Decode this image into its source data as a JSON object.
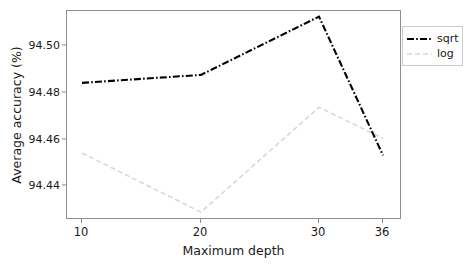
{
  "chart_data": {
    "type": "line",
    "title": "",
    "xlabel": "Maximum depth",
    "ylabel": "Average accuracy (%)",
    "categories": [
      "10",
      "20",
      "30",
      "36"
    ],
    "x_tick_positions_px": [
      81,
      200,
      318,
      382
    ],
    "y_ticks": [
      "94.44",
      "94.46",
      "94.48",
      "94.50"
    ],
    "y_tick_values": [
      94.44,
      94.46,
      94.48,
      94.5
    ],
    "ylim": [
      94.4255,
      94.5151
    ],
    "grid": false,
    "legend_position": "upper right",
    "series": [
      {
        "name": "sqrt",
        "color": "#000000",
        "linestyle": "dashdot",
        "values": [
          94.4843,
          94.4877,
          94.5127,
          94.4532
        ]
      },
      {
        "name": "log",
        "color": "#d6d6d6",
        "linestyle": "dashed",
        "values": [
          94.4542,
          94.4289,
          94.4738,
          94.4605
        ]
      }
    ]
  },
  "legend": {
    "entries": [
      {
        "label": "sqrt"
      },
      {
        "label": "log"
      }
    ]
  },
  "axes": {
    "xlabel": "Maximum depth",
    "ylabel": "Average accuracy (%)",
    "x_tick_labels": [
      "10",
      "20",
      "30",
      "36"
    ],
    "y_tick_labels": [
      "94.44",
      "94.46",
      "94.48",
      "94.50"
    ]
  },
  "colors": {
    "sqrt_line": "#000000",
    "log_line": "#d6d6d6",
    "spine": "#8e8e8e",
    "text": "#1a1a1a",
    "background": "#ffffff"
  }
}
